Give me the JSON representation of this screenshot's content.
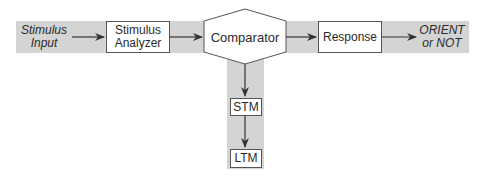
{
  "diagram": {
    "input_label": [
      "Stimulus",
      "Input"
    ],
    "nodes": {
      "stimulus_analyzer": [
        "Stimulus",
        "Analyzer"
      ],
      "comparator": "Comparator",
      "response": "Response",
      "stm": "STM",
      "ltm": "LTM"
    },
    "output_label": [
      "ORIENT",
      "or NOT"
    ],
    "edges": [
      {
        "from": "Stimulus Input",
        "to": "Stimulus Analyzer"
      },
      {
        "from": "Stimulus Analyzer",
        "to": "Comparator"
      },
      {
        "from": "Comparator",
        "to": "Response"
      },
      {
        "from": "Response",
        "to": "ORIENT or NOT"
      },
      {
        "from": "Comparator",
        "to": "STM"
      },
      {
        "from": "STM",
        "to": "LTM"
      }
    ],
    "colors": {
      "band": "#d4d4d4",
      "box_border": "#555555",
      "arrow": "#333333"
    }
  }
}
